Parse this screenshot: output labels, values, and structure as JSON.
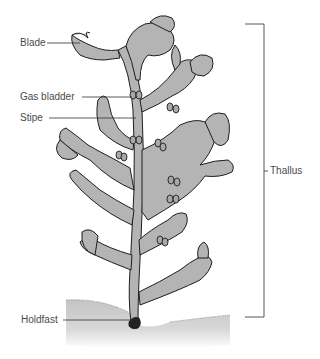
{
  "diagram": {
    "labels": {
      "blade": "Blade",
      "gas_bladder": "Gas bladder",
      "stipe": "Stipe",
      "thallus": "Thallus",
      "holdfast": "Holdfast"
    },
    "colors": {
      "thallus_fill": "#b4b4b4",
      "outline": "#1e1e1e",
      "label_text": "#4a4a4a",
      "leader_line": "#333333",
      "substrate": "#c8c8c8"
    }
  }
}
